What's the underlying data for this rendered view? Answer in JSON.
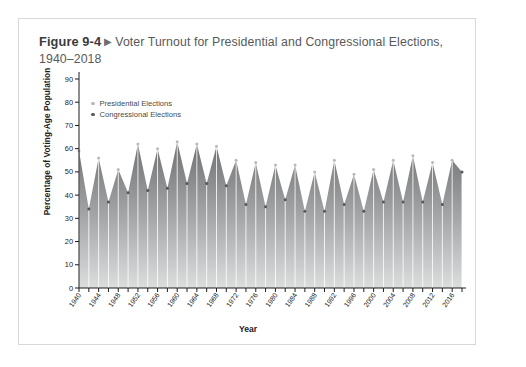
{
  "figure": {
    "number": "Figure 9-4",
    "marker": "▶",
    "caption": "Voter Turnout for Presidential and Congressional Elections, 1940–2018"
  },
  "legend": {
    "presidential": "Presidential Elections",
    "congressional": "Congressional Elections"
  },
  "colors": {
    "fill_top": "#6f7072",
    "fill_bottom": "#d6d7d8",
    "presidential_dot": "#b9b9b9",
    "congressional_dot": "#58585a",
    "axis": "#1c1c1c",
    "card_border": "#d8d8d8",
    "title_text": "#58595b"
  },
  "chart_data": {
    "type": "area",
    "title": "Voter Turnout for Presidential and Congressional Elections, 1940–2018",
    "xlabel": "Year",
    "ylabel": "Percentage of Voting-Age Population",
    "ylim": [
      0,
      90
    ],
    "ytick_step": 10,
    "yticks": [
      0,
      10,
      20,
      30,
      40,
      50,
      60,
      70,
      80,
      90
    ],
    "xlim": [
      1940,
      2018
    ],
    "xtick_labels": [
      "1940",
      "1944",
      "1948",
      "1952",
      "1956",
      "1960",
      "1964",
      "1968",
      "1972",
      "1976",
      "1980",
      "1984",
      "1988",
      "1992",
      "1996",
      "2000",
      "2004",
      "2008",
      "2012",
      "2016"
    ],
    "xtick_step": 4,
    "minor_tick_step": 2,
    "grid": false,
    "legend_position": "upper-left-inside",
    "x": [
      1940,
      1942,
      1944,
      1946,
      1948,
      1950,
      1952,
      1954,
      1956,
      1958,
      1960,
      1962,
      1964,
      1966,
      1968,
      1970,
      1972,
      1974,
      1976,
      1978,
      1980,
      1982,
      1984,
      1986,
      1988,
      1990,
      1992,
      1994,
      1996,
      1998,
      2000,
      2002,
      2004,
      2006,
      2008,
      2010,
      2012,
      2014,
      2016,
      2018
    ],
    "values": [
      59,
      34,
      56,
      37,
      51,
      41,
      62,
      42,
      60,
      43,
      63,
      45,
      62,
      45,
      61,
      44,
      55,
      36,
      54,
      35,
      53,
      38,
      53,
      33,
      50,
      33,
      55,
      36,
      49,
      33,
      51,
      37,
      55,
      37,
      57,
      37,
      54,
      36,
      55,
      50
    ],
    "series": [
      {
        "name": "Presidential Elections",
        "x": [
          1940,
          1944,
          1948,
          1952,
          1956,
          1960,
          1964,
          1968,
          1972,
          1976,
          1980,
          1984,
          1988,
          1992,
          1996,
          2000,
          2004,
          2008,
          2012,
          2016
        ],
        "values": [
          59,
          56,
          51,
          62,
          60,
          63,
          62,
          61,
          55,
          54,
          53,
          53,
          50,
          55,
          49,
          51,
          55,
          57,
          54,
          55
        ]
      },
      {
        "name": "Congressional Elections",
        "x": [
          1942,
          1946,
          1950,
          1954,
          1958,
          1962,
          1966,
          1970,
          1974,
          1978,
          1982,
          1986,
          1990,
          1994,
          1998,
          2002,
          2006,
          2010,
          2014,
          2018
        ],
        "values": [
          34,
          37,
          41,
          42,
          43,
          45,
          45,
          44,
          36,
          35,
          38,
          33,
          33,
          36,
          33,
          37,
          37,
          37,
          36,
          50
        ]
      }
    ]
  }
}
